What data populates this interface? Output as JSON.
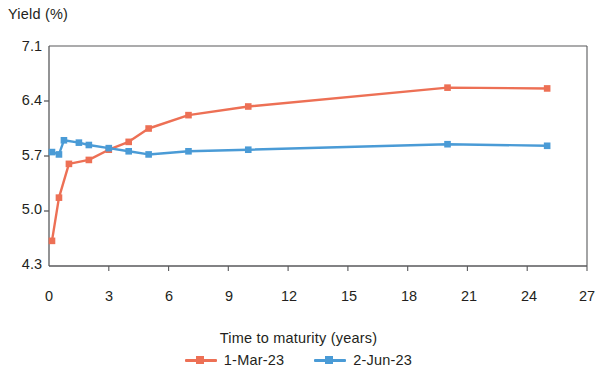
{
  "chart_data": {
    "type": "line",
    "title": "",
    "xlabel": "Time to maturity (years)",
    "ylabel": "Yield (%)",
    "xlim": [
      0,
      27
    ],
    "ylim": [
      4.3,
      7.1
    ],
    "xticks": [
      0,
      3,
      6,
      9,
      12,
      15,
      18,
      21,
      24,
      27
    ],
    "yticks": [
      4.3,
      5.0,
      5.7,
      6.4,
      7.1
    ],
    "grid": false,
    "legend_position": "bottom",
    "series": [
      {
        "name": "1-Mar-23",
        "color": "#ED7055",
        "marker": "square",
        "x": [
          0.15,
          0.5,
          1.0,
          2.0,
          3.0,
          4.0,
          5.0,
          7.0,
          10.0,
          20.0,
          25.0
        ],
        "y": [
          4.62,
          5.17,
          5.6,
          5.65,
          5.78,
          5.88,
          6.05,
          6.22,
          6.33,
          6.57,
          6.56
        ]
      },
      {
        "name": "2-Jun-23",
        "color": "#4A9BD6",
        "marker": "square",
        "x": [
          0.15,
          0.5,
          0.75,
          1.5,
          2.0,
          3.0,
          4.0,
          5.0,
          7.0,
          10.0,
          20.0,
          25.0
        ],
        "y": [
          5.75,
          5.72,
          5.9,
          5.87,
          5.84,
          5.8,
          5.76,
          5.72,
          5.76,
          5.78,
          5.85,
          5.83
        ]
      }
    ]
  },
  "axis": {
    "y_title": "Yield (%)",
    "x_title": "Time to maturity (years)",
    "y_labels": [
      "7.1",
      "6.4",
      "5.7",
      "5.0",
      "4.3"
    ],
    "x_labels": [
      "0",
      "3",
      "6",
      "9",
      "12",
      "15",
      "18",
      "21",
      "24",
      "27"
    ]
  },
  "legend": {
    "items": [
      {
        "label": "1-Mar-23",
        "color": "#ED7055"
      },
      {
        "label": "2-Jun-23",
        "color": "#4A9BD6"
      }
    ]
  },
  "colors": {
    "series_1": "#ED7055",
    "series_2": "#4A9BD6",
    "axis": "#58595b",
    "text": "#231f20"
  }
}
